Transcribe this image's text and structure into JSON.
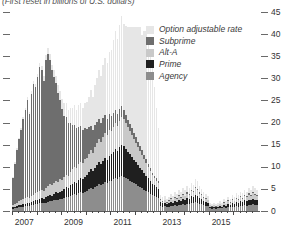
{
  "chart_data": {
    "type": "bar",
    "stacked": true,
    "title": "(First reset in billions of U.S. dollars)",
    "xlabel": "",
    "ylabel": "",
    "ylim": [
      0,
      45
    ],
    "yticks": [
      0,
      5,
      10,
      15,
      20,
      25,
      30,
      35,
      40,
      45
    ],
    "grid": false,
    "legend_position": "inside-top-right",
    "axis_side": "right",
    "x_tick_labels": [
      "2007",
      "2009",
      "2011",
      "2013",
      "2015"
    ],
    "x_tick_years": [
      2007,
      2009,
      2011,
      2013,
      2015
    ],
    "x_start": "2007-01",
    "x_end": "2016-12",
    "series": [
      {
        "name": "Agency",
        "color": "#8d8d8d",
        "values": [
          0.5,
          0.6,
          0.7,
          0.8,
          0.9,
          1.0,
          1.1,
          1.2,
          1.1,
          1.3,
          1.4,
          1.5,
          1.6,
          1.7,
          1.8,
          1.7,
          1.9,
          2.1,
          2.3,
          2.2,
          2.4,
          2.6,
          2.5,
          2.7,
          2.8,
          3.0,
          3.2,
          3.1,
          3.4,
          3.6,
          3.8,
          3.7,
          4.0,
          4.2,
          4.1,
          4.4,
          4.6,
          4.9,
          5.2,
          5.0,
          5.4,
          5.7,
          6.0,
          5.8,
          6.2,
          6.5,
          6.3,
          6.7,
          6.9,
          7.2,
          7.5,
          7.3,
          7.7,
          8.0,
          7.8,
          7.5,
          7.2,
          6.9,
          6.6,
          6.3,
          6.0,
          5.7,
          5.4,
          5.1,
          4.8,
          4.5,
          4.2,
          3.9,
          3.6,
          3.4,
          3.2,
          3.0,
          1.2,
          1.0,
          1.1,
          0.9,
          1.0,
          1.2,
          1.1,
          1.3,
          1.2,
          1.4,
          1.3,
          1.5,
          1.4,
          1.6,
          1.5,
          1.8,
          1.7,
          2.0,
          1.9,
          1.6,
          1.5,
          1.3,
          1.2,
          1.1,
          0.6,
          0.5,
          0.6,
          0.5,
          0.6,
          0.7,
          0.6,
          0.8,
          0.7,
          0.9,
          0.8,
          1.0,
          0.9,
          1.1,
          1.0,
          1.2,
          1.1,
          1.3,
          1.2,
          1.4,
          1.3,
          1.5,
          1.4,
          1.3
        ]
      },
      {
        "name": "Prime",
        "color": "#1f1f1f",
        "values": [
          0.3,
          0.4,
          0.4,
          0.5,
          0.5,
          0.6,
          0.6,
          0.7,
          0.7,
          0.8,
          0.8,
          0.9,
          0.9,
          1.0,
          1.1,
          1.0,
          1.2,
          1.3,
          1.4,
          1.3,
          1.5,
          1.6,
          1.5,
          1.7,
          1.8,
          2.0,
          2.2,
          2.1,
          2.4,
          2.6,
          2.8,
          2.7,
          3.0,
          3.2,
          3.1,
          3.4,
          3.6,
          3.9,
          4.2,
          4.0,
          4.4,
          4.7,
          5.0,
          4.8,
          5.2,
          5.5,
          5.3,
          5.7,
          5.9,
          6.2,
          6.5,
          6.3,
          6.7,
          7.0,
          6.8,
          6.5,
          6.2,
          5.9,
          5.6,
          5.3,
          5.0,
          4.7,
          4.4,
          4.1,
          3.8,
          3.5,
          3.2,
          2.9,
          2.6,
          2.4,
          2.2,
          2.0,
          0.8,
          0.7,
          0.8,
          0.6,
          0.7,
          0.9,
          0.8,
          1.0,
          0.9,
          1.1,
          1.0,
          1.2,
          1.1,
          1.3,
          1.2,
          1.5,
          1.4,
          1.7,
          1.6,
          1.3,
          1.2,
          1.0,
          0.9,
          0.8,
          0.4,
          0.3,
          0.4,
          0.3,
          0.4,
          0.5,
          0.4,
          0.6,
          0.5,
          0.7,
          0.6,
          0.8,
          0.7,
          0.9,
          0.8,
          1.0,
          0.9,
          1.1,
          1.0,
          1.2,
          1.1,
          1.3,
          1.2,
          1.1
        ]
      },
      {
        "name": "Alt-A",
        "color": "#c9c9c9",
        "values": [
          0.6,
          0.7,
          0.8,
          0.9,
          1.0,
          1.1,
          1.2,
          1.3,
          1.2,
          1.4,
          1.5,
          1.6,
          1.7,
          1.8,
          1.9,
          1.8,
          2.0,
          2.2,
          2.4,
          2.3,
          2.5,
          2.7,
          2.6,
          2.8,
          2.4,
          2.6,
          2.8,
          2.7,
          3.0,
          3.2,
          3.4,
          3.3,
          3.6,
          3.8,
          3.7,
          4.0,
          3.8,
          4.1,
          4.4,
          4.2,
          4.6,
          4.9,
          5.2,
          5.0,
          5.4,
          5.7,
          5.5,
          5.9,
          5.2,
          5.5,
          5.8,
          5.6,
          6.0,
          6.3,
          6.1,
          5.8,
          5.5,
          5.2,
          4.9,
          4.6,
          4.3,
          4.0,
          3.7,
          3.4,
          3.1,
          2.8,
          2.5,
          2.2,
          1.9,
          1.7,
          1.5,
          1.3,
          0.5,
          0.4,
          0.5,
          0.4,
          0.5,
          0.6,
          0.5,
          0.7,
          0.6,
          0.8,
          0.7,
          0.9,
          0.8,
          1.0,
          0.9,
          1.2,
          1.1,
          1.4,
          1.3,
          1.0,
          0.9,
          0.7,
          0.6,
          0.5,
          0.3,
          0.2,
          0.3,
          0.2,
          0.3,
          0.4,
          0.3,
          0.5,
          0.4,
          0.6,
          0.5,
          0.7,
          0.6,
          0.8,
          0.7,
          0.9,
          0.8,
          1.0,
          0.9,
          1.1,
          1.0,
          1.2,
          1.1,
          1.0
        ]
      },
      {
        "name": "Subprime",
        "color": "#6e6e6e",
        "values": [
          6.0,
          9.0,
          12.0,
          14.0,
          16.0,
          18.0,
          20.0,
          22.0,
          19.0,
          23.0,
          25.0,
          24.0,
          26.0,
          28.0,
          27.0,
          25.0,
          29.0,
          30.0,
          28.0,
          26.0,
          24.0,
          22.0,
          20.0,
          18.0,
          16.0,
          14.0,
          13.0,
          12.0,
          11.0,
          10.0,
          9.5,
          9.0,
          8.5,
          8.0,
          7.5,
          7.0,
          6.5,
          6.0,
          5.5,
          5.2,
          5.0,
          4.8,
          4.6,
          4.4,
          4.2,
          4.0,
          3.8,
          3.6,
          3.4,
          3.2,
          3.0,
          2.8,
          2.6,
          2.4,
          2.2,
          2.0,
          1.8,
          1.7,
          1.6,
          1.5,
          1.4,
          1.3,
          1.2,
          1.1,
          1.0,
          0.9,
          0.8,
          0.7,
          0.6,
          0.5,
          0.5,
          0.4,
          0.2,
          0.2,
          0.2,
          0.1,
          0.2,
          0.2,
          0.2,
          0.2,
          0.2,
          0.3,
          0.2,
          0.3,
          0.2,
          0.3,
          0.3,
          0.3,
          0.3,
          0.4,
          0.3,
          0.3,
          0.2,
          0.2,
          0.2,
          0.1,
          0.1,
          0.1,
          0.1,
          0.1,
          0.1,
          0.1,
          0.1,
          0.2,
          0.1,
          0.2,
          0.1,
          0.2,
          0.1,
          0.2,
          0.2,
          0.2,
          0.2,
          0.2,
          0.2,
          0.3,
          0.2,
          0.3,
          0.2,
          0.2
        ]
      },
      {
        "name": "Option adjustable rate",
        "color": "#e6e6e6",
        "values": [
          0.2,
          0.3,
          0.3,
          0.4,
          0.4,
          0.5,
          0.5,
          0.6,
          0.5,
          0.7,
          0.8,
          0.8,
          0.9,
          1.0,
          1.1,
          1.0,
          1.2,
          1.3,
          1.4,
          1.3,
          1.5,
          1.6,
          1.8,
          2.0,
          2.4,
          2.8,
          3.2,
          3.0,
          3.6,
          4.0,
          4.4,
          4.2,
          4.8,
          5.2,
          5.0,
          5.6,
          6.2,
          7.0,
          8.0,
          7.5,
          9.0,
          10.0,
          11.0,
          10.5,
          12.0,
          13.0,
          12.5,
          14.0,
          15.0,
          16.5,
          18.0,
          17.0,
          19.0,
          20.5,
          19.5,
          20.0,
          21.0,
          22.0,
          23.0,
          24.0,
          25.0,
          26.0,
          27.0,
          26.0,
          28.0,
          29.0,
          27.5,
          26.0,
          24.0,
          20.0,
          16.0,
          12.0,
          1.0,
          0.8,
          0.9,
          0.7,
          0.8,
          1.0,
          0.9,
          1.1,
          1.0,
          1.2,
          1.1,
          1.3,
          1.2,
          1.4,
          1.3,
          1.6,
          1.5,
          1.8,
          1.7,
          1.4,
          1.3,
          1.1,
          1.0,
          0.9,
          0.5,
          0.4,
          0.5,
          0.4,
          0.5,
          0.6,
          0.5,
          0.7,
          0.6,
          0.8,
          0.7,
          0.9,
          0.8,
          1.0,
          0.9,
          1.1,
          1.0,
          1.2,
          1.1,
          1.3,
          1.2,
          1.4,
          1.3,
          1.2
        ]
      }
    ]
  },
  "legend": {
    "items": [
      {
        "label": "Option adjustable rate",
        "color": "#e6e6e6"
      },
      {
        "label": "Subprime",
        "color": "#6e6e6e"
      },
      {
        "label": "Alt-A",
        "color": "#c9c9c9"
      },
      {
        "label": "Prime",
        "color": "#1f1f1f"
      },
      {
        "label": "Agency",
        "color": "#8d8d8d"
      }
    ]
  }
}
